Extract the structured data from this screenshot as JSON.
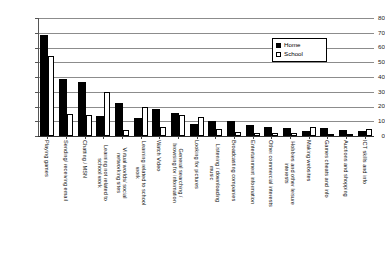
{
  "chart_data": {
    "type": "bar",
    "title": "",
    "xlabel": "",
    "ylabel": "",
    "ylim": [
      0,
      80
    ],
    "ytick_step": 10,
    "yticks": [
      0,
      10,
      20,
      30,
      40,
      50,
      60,
      70,
      80
    ],
    "grid": true,
    "legend_position": "top-right",
    "categories": [
      "Playing games",
      "Sending/ receiving email",
      "Chatting / MSN",
      "Learning not related to school work",
      "Virtual worlds/ social networking sites",
      "Learning related to school work",
      "Watch Video",
      "General searching / browsing for information",
      "Looking for pictures",
      "Listening / downloading music",
      "Broadcasting companies",
      "Entertainment information",
      "Other commercial interests",
      "Hobbies and other leisure interests",
      "Making websites",
      "Games cheats and info",
      "Auctions and shopping",
      "ICT skills and info"
    ],
    "series": [
      {
        "name": "Home",
        "color": "#000000",
        "values": [
          67,
          37,
          35,
          12,
          21,
          11,
          17,
          14,
          7,
          9,
          9,
          6,
          5,
          4,
          2,
          4,
          3,
          2
        ]
      },
      {
        "name": "School",
        "color": "#ffffff",
        "values": [
          54,
          15,
          14,
          30,
          4,
          20,
          6,
          14,
          13,
          5,
          3,
          2,
          2,
          2,
          6,
          1,
          1,
          5
        ]
      }
    ]
  },
  "legend": {
    "items": [
      {
        "label": "Home",
        "swatch": "filled-black-square"
      },
      {
        "label": "School",
        "swatch": "outlined-white-square"
      }
    ]
  }
}
